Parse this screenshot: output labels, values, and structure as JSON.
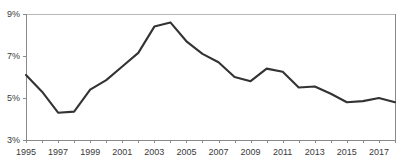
{
  "chart_data": {
    "type": "line",
    "title": "",
    "subtitle": "",
    "xlabel": "",
    "ylabel": "",
    "grid": false,
    "legend": null,
    "legend_position": "none",
    "line_color": "#333333",
    "axis_color": "#8a8a8a",
    "text_color": "#3a3a3a",
    "xlim": [
      1995,
      2018
    ],
    "ylim": [
      3,
      9
    ],
    "y_ticks": [
      3,
      5,
      7,
      9
    ],
    "y_tick_labels": [
      "3%",
      "5%",
      "7%",
      "9%"
    ],
    "x_ticks": [
      1995,
      1996,
      1997,
      1998,
      1999,
      2000,
      2001,
      2002,
      2003,
      2004,
      2005,
      2006,
      2007,
      2008,
      2009,
      2010,
      2011,
      2012,
      2013,
      2014,
      2015,
      2016,
      2017,
      2018
    ],
    "x_tick_labels": [
      "1995",
      "",
      "1997",
      "",
      "1999",
      "",
      "2001",
      "",
      "2003",
      "",
      "2005",
      "",
      "2007",
      "",
      "2009",
      "",
      "2011",
      "",
      "2013",
      "",
      "2015",
      "",
      "2017",
      ""
    ],
    "x": [
      1995,
      1996,
      1997,
      1998,
      1999,
      2000,
      2001,
      2002,
      2003,
      2004,
      2005,
      2006,
      2007,
      2008,
      2009,
      2010,
      2011,
      2012,
      2013,
      2014,
      2015,
      2016,
      2017,
      2018
    ],
    "values": [
      6.1,
      5.3,
      4.3,
      4.35,
      5.4,
      5.85,
      6.5,
      7.15,
      8.4,
      8.6,
      7.7,
      7.1,
      6.7,
      6.0,
      5.8,
      6.4,
      6.25,
      5.5,
      5.55,
      5.2,
      4.8,
      4.85,
      5.0,
      4.8
    ],
    "series": [
      {
        "name": "",
        "values": [
          6.1,
          5.3,
          4.3,
          4.35,
          5.4,
          5.85,
          6.5,
          7.15,
          8.4,
          8.6,
          7.7,
          7.1,
          6.7,
          6.0,
          5.8,
          6.4,
          6.25,
          5.5,
          5.55,
          5.2,
          4.8,
          4.85,
          5.0,
          4.8
        ]
      }
    ]
  },
  "plot_geometry": {
    "left": 26,
    "right": 395,
    "top": 14,
    "bottom": 140
  }
}
